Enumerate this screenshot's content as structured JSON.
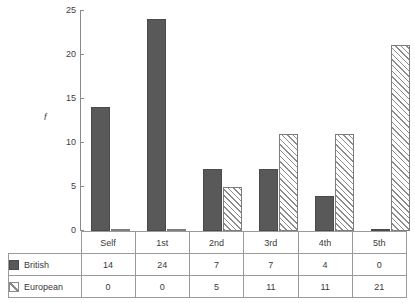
{
  "chart_data": {
    "type": "bar",
    "title": "",
    "xlabel": "",
    "ylabel": "f",
    "ylim": [
      0,
      25
    ],
    "yticks": [
      0,
      5,
      10,
      15,
      20,
      25
    ],
    "ytick_labels": [
      "0",
      "5",
      "10",
      "15",
      "20",
      "25"
    ],
    "grid": false,
    "legend_position": "table-left",
    "categories": [
      "Self",
      "1st",
      "2nd",
      "3rd",
      "4th",
      "5th"
    ],
    "series": [
      {
        "name": "British",
        "swatch": "solid-dark-gray",
        "color": "#595959",
        "values": [
          14,
          24,
          7,
          7,
          4,
          0
        ]
      },
      {
        "name": "European",
        "swatch": "diagonal-hatch",
        "color": "#ffffff",
        "values": [
          0,
          0,
          5,
          11,
          11,
          21
        ]
      }
    ]
  },
  "axis": {
    "y_label": "f"
  },
  "table": {
    "header_blank": "",
    "column_headers": [
      "Self",
      "1st",
      "2nd",
      "3rd",
      "4th",
      "5th"
    ],
    "rows": [
      {
        "label": "British",
        "values": [
          "14",
          "24",
          "7",
          "7",
          "4",
          "0"
        ]
      },
      {
        "label": "European",
        "values": [
          "0",
          "0",
          "5",
          "11",
          "11",
          "21"
        ]
      }
    ]
  }
}
